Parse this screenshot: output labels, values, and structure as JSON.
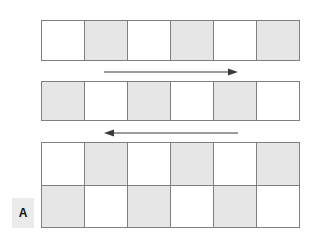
{
  "figure": {
    "panel_label": "A",
    "colors": {
      "shaded_cell": "#e6e6e6",
      "unshaded_cell": "#ffffff",
      "grid_line": "#7f7f7f",
      "arrow": "#3a3a3a",
      "label_background": "#ebebeb",
      "label_text": "#111111",
      "page_background": "#ffffff"
    },
    "grids": [
      {
        "name": "top-strip",
        "columns": 6,
        "rows": [
          {
            "name": "top-strip-row-1",
            "cells": [
              0,
              1,
              0,
              1,
              0,
              1
            ]
          }
        ]
      },
      {
        "name": "middle-strip",
        "columns": 6,
        "rows": [
          {
            "name": "middle-strip-row-1",
            "cells": [
              1,
              0,
              1,
              0,
              1,
              0
            ]
          }
        ]
      },
      {
        "name": "bottom-strip",
        "columns": 6,
        "rows": [
          {
            "name": "bottom-strip-row-1",
            "cells": [
              0,
              1,
              0,
              1,
              0,
              1
            ]
          },
          {
            "name": "bottom-strip-row-2",
            "cells": [
              1,
              0,
              1,
              0,
              1,
              0
            ]
          }
        ]
      }
    ],
    "arrows": [
      {
        "name": "arrow-right",
        "direction": "right",
        "label": ""
      },
      {
        "name": "arrow-left",
        "direction": "left",
        "label": ""
      }
    ]
  }
}
